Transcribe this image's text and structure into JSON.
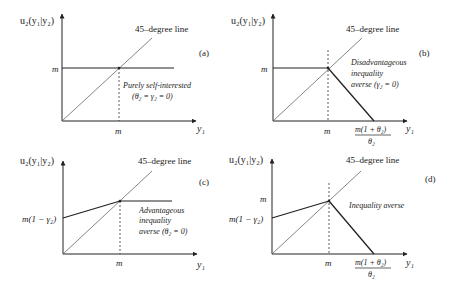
{
  "figure": {
    "ylabel": "u₂(y₁|y₂)",
    "xlabel": "y₁",
    "diag_label": "45–degree line",
    "m": "m",
    "m_gamma": "m(1 − γ₂)",
    "root_num": "m(1 + θ₂)",
    "root_den": "θ₂"
  },
  "panels": [
    {
      "id": "a",
      "tag": "(a)",
      "note1": "Purely self-interested",
      "note2": "(θ₂ = γ₂ = 0)"
    },
    {
      "id": "b",
      "tag": "(b)",
      "note1": "Disadvantageous",
      "note2": "inequality",
      "note3": "averse (γ₂ = 0)"
    },
    {
      "id": "c",
      "tag": "(c)",
      "note1": "Advantageous",
      "note2": "inequality",
      "note3": "averse (θ₂ = 0)"
    },
    {
      "id": "d",
      "tag": "(d)",
      "note1": "Inequality averse"
    }
  ]
}
